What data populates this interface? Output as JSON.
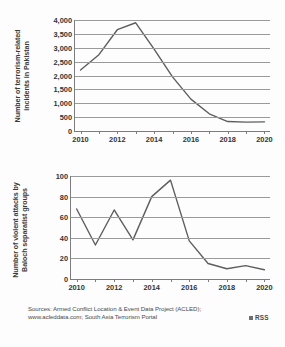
{
  "figure": {
    "background_color": "#fdfdfd",
    "line_color": "#5e5e5e",
    "grid_color": "#9a9a9a",
    "axis_color": "#7d7d7d"
  },
  "footer": {
    "line1": "Sources: Armed Conflict Location & Event Data Project (ACLED);",
    "line2": "www.acleddata.com; South Asia Terrorism Portal"
  },
  "logo": {
    "text": "RSS"
  },
  "chart_data": [
    {
      "id": "terrorism-incidents",
      "type": "line",
      "title": "",
      "ylabel": "Number of terrorism-related incidents in Pakistan",
      "xlabel": "",
      "x": [
        2010,
        2011,
        2012,
        2013,
        2014,
        2015,
        2016,
        2017,
        2018,
        2019,
        2020
      ],
      "values": [
        2200,
        2750,
        3650,
        3900,
        2950,
        1950,
        1150,
        620,
        340,
        320,
        330
      ],
      "xlim": [
        2009.7,
        2020.3
      ],
      "ylim": [
        0,
        4000
      ],
      "yticks": [
        0,
        500,
        1000,
        1500,
        2000,
        2500,
        3000,
        3500,
        4000
      ],
      "ytick_labels": [
        "0",
        "500",
        "1,000",
        "1,500",
        "2,000",
        "2,500",
        "3,000",
        "3,500",
        "4,000"
      ],
      "xticks": [
        2010,
        2012,
        2014,
        2016,
        2018,
        2020
      ],
      "xtick_labels": [
        "2010",
        "2012",
        "2014",
        "2016",
        "2018",
        "2020"
      ],
      "grid": true,
      "legend": false
    },
    {
      "id": "baloch-attacks",
      "type": "line",
      "title": "",
      "ylabel": "Number of violent attacks by Baloch separatist groups",
      "xlabel": "",
      "x": [
        2010,
        2011,
        2012,
        2013,
        2014,
        2015,
        2016,
        2017,
        2018,
        2019,
        2020
      ],
      "values": [
        68,
        33,
        67,
        38,
        80,
        96,
        37,
        15,
        10,
        13,
        9
      ],
      "xlim": [
        2009.7,
        2020.3
      ],
      "ylim": [
        0,
        100
      ],
      "yticks": [
        0,
        20,
        40,
        60,
        80,
        100
      ],
      "ytick_labels": [
        "0",
        "20",
        "40",
        "60",
        "80",
        "100"
      ],
      "xticks": [
        2010,
        2012,
        2014,
        2016,
        2018,
        2020
      ],
      "xtick_labels": [
        "2010",
        "2012",
        "2014",
        "2016",
        "2018",
        "2020"
      ],
      "grid": true,
      "legend": false
    }
  ]
}
